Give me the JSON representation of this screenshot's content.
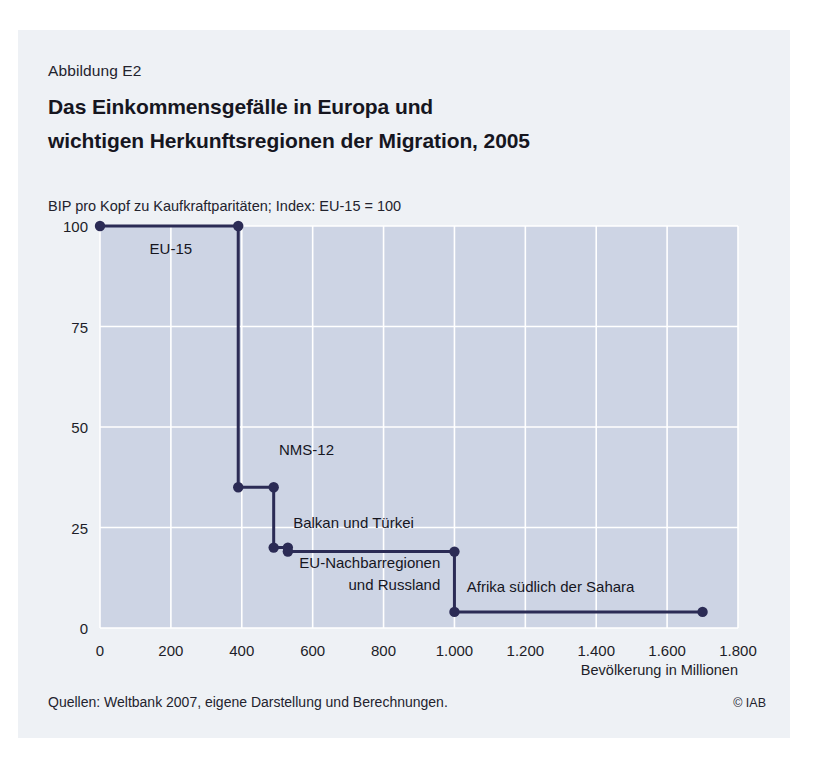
{
  "figure": {
    "number": "Abbildung E2",
    "title_line_1": "Das Einkommensgefälle in Europa und",
    "title_line_2": "wichtigen Herkunftsregionen der Migration, 2005",
    "source_note": "Quellen: Weltbank 2007, eigene Darstellung und Berechnungen.",
    "copyright": "© IAB",
    "panel_color": "#eef1f5",
    "plot_background": "#cdd4e4",
    "line_color": "#2b2b55",
    "grid_color": "#ffffff"
  },
  "chart_data": {
    "type": "line",
    "title": "Das Einkommensgefälle in Europa und wichtigen Herkunftsregionen der Migration, 2005",
    "subtitle": "BIP pro Kopf zu Kaufkraftparitäten; Index: EU-15 = 100",
    "xlabel": "Bevölkerung in Millionen",
    "ylabel": "BIP pro Kopf zu Kaufkraftparitäten; Index: EU-15 = 100",
    "xlim": [
      0,
      1800
    ],
    "ylim": [
      0,
      100
    ],
    "xticks": [
      0,
      200,
      400,
      600,
      800,
      1000,
      1200,
      1400,
      1600,
      1800
    ],
    "xticklabels": [
      "0",
      "200",
      "400",
      "600",
      "800",
      "1.000",
      "1.200",
      "1.400",
      "1.600",
      "1.800"
    ],
    "yticks": [
      0,
      25,
      50,
      75,
      100
    ],
    "yticklabels": [
      "0",
      "25",
      "50",
      "75",
      "100"
    ],
    "grid": true,
    "legend": "none",
    "annotation_note": "Stufenkurve: kumulierte Bevölkerung gegen BIP pro Kopf (Index EU-15 = 100)",
    "series": [
      {
        "name": "EU-15",
        "label": "EU-15",
        "gdp_index": 100,
        "population_start": 0,
        "population_end": 390,
        "label_x": 200,
        "label_y": 93
      },
      {
        "name": "NMS-12",
        "label": "NMS-12",
        "gdp_index": 35,
        "population_start": 390,
        "population_end": 490,
        "label_x": 505,
        "label_y": 43
      },
      {
        "name": "Balkan und Türkei",
        "label": "Balkan und Türkei",
        "gdp_index": 20,
        "population_start": 490,
        "population_end": 530,
        "label_x": 545,
        "label_y": 25
      },
      {
        "name": "EU-Nachbarregionen und Russland",
        "label_line_1": "EU-Nachbarregionen",
        "label_line_2": "und Russland",
        "gdp_index": 19,
        "population_start": 530,
        "population_end": 1000,
        "label_x": 960,
        "label_y": 15
      },
      {
        "name": "Afrika südlich der Sahara",
        "label": "Afrika südlich der Sahara",
        "gdp_index": 4,
        "population_start": 1000,
        "population_end": 1700,
        "label_x": 1035,
        "label_y": 9
      }
    ]
  }
}
